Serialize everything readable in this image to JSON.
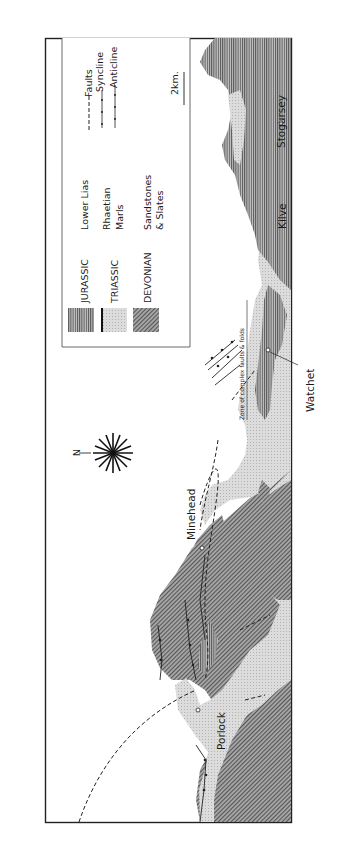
{
  "map": {
    "title_hidden": "Geological map of the West Somerset coast",
    "orientation": "rotated 90 degrees (north arrow points left)",
    "north_label": "N",
    "scale_label": "2km.",
    "annotation": "Zone of complex faults & folds",
    "towns": [
      {
        "name": "Stogursey"
      },
      {
        "name": "Kilve"
      },
      {
        "name": "Watchet"
      },
      {
        "name": "Minehead"
      },
      {
        "name": "Porlock"
      }
    ],
    "legend": {
      "units": [
        {
          "period": "JURASSIC",
          "description": "Lower Lias",
          "pattern": "vertical-lines"
        },
        {
          "period": "TRIASSIC",
          "description_line1": "Rhaetian",
          "description_line2": "Marls",
          "pattern": "light-stipple"
        },
        {
          "period": "DEVONIAN",
          "description_line1": "Sandstones",
          "description_line2": "& Slates",
          "pattern": "diagonal-hatch"
        }
      ],
      "structures": [
        {
          "label": "Faults",
          "symbol": "dashed-line"
        },
        {
          "label": "Syncline",
          "symbol": "line-with-crosses"
        },
        {
          "label": "Anticline",
          "symbol": "line-with-crosses"
        }
      ]
    },
    "colors": {
      "frame": "#222222",
      "jurassic": "#9a9a9a",
      "triassic": "#d6d6d6",
      "devonian": "#8c8c8c",
      "sea": "#ffffff"
    }
  }
}
